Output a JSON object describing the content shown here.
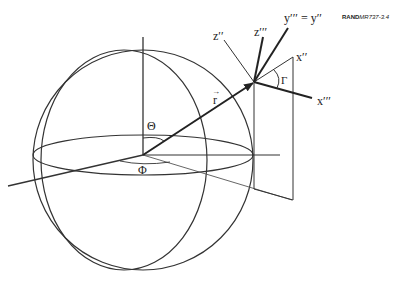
{
  "figure": {
    "tag_bold": "RAND",
    "tag_italic": "MR737-3.4",
    "labels": {
      "theta": "Θ",
      "phi": "Φ",
      "r_vector": "r",
      "gamma": "Γ",
      "z_double_prime": "z′′",
      "z_triple_prime": "z′′′",
      "y_equation": "y′′′ = y′′",
      "x_double_prime": "x′′",
      "x_triple_prime": "x′′′"
    }
  },
  "colors": {
    "stroke": "#333333",
    "background": "#ffffff"
  }
}
